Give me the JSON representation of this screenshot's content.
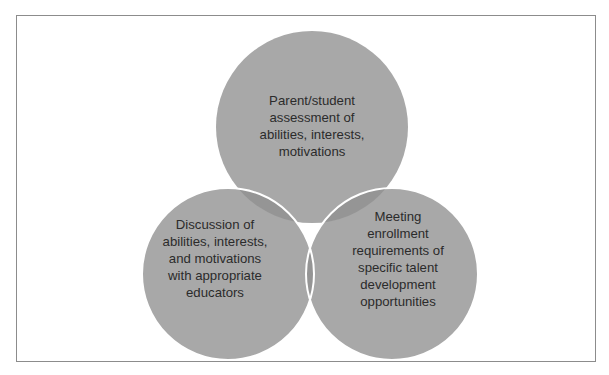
{
  "diagram": {
    "type": "venn",
    "colors": {
      "circle_fill": "#a8a8a8",
      "overlap_tint": "#7f7f7f",
      "circle_stroke": "#ffffff",
      "text": "#2b2b2b",
      "frame_border": "#8c8c8c",
      "background": "#ffffff"
    },
    "sets": [
      {
        "id": "top",
        "label": "Parent/student\nassessment of\nabilities, interests,\nmotivations"
      },
      {
        "id": "left",
        "label": "Discussion of\nabilities, interests,\nand motivations\nwith appropriate\neducators"
      },
      {
        "id": "right",
        "label": "Meeting\nenrollment\nrequirements of\nspecific talent\ndevelopment\nopportunities"
      }
    ]
  }
}
